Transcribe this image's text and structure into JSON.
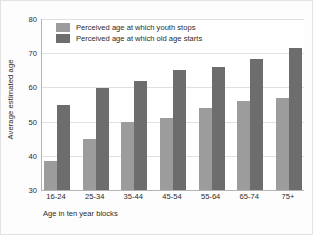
{
  "chart_data": {
    "type": "bar",
    "title": "",
    "xlabel": "Age in ten year blocks",
    "ylabel": "Average estimated age",
    "ylim": [
      30,
      80
    ],
    "ytick_labels": [
      "80",
      "70",
      "60",
      "50",
      "40",
      "30"
    ],
    "ytick_values": [
      80,
      70,
      60,
      50,
      40,
      30
    ],
    "grid": true,
    "legend_position": "top-left",
    "categories": [
      "16-24",
      "25-34",
      "35-44",
      "45-54",
      "55-64",
      "65-74",
      "75+"
    ],
    "series": [
      {
        "name": "Perceived age at which youth stops",
        "color": "#9c9c9c",
        "values": [
          38.5,
          45,
          49.8,
          51,
          54,
          56,
          57
        ]
      },
      {
        "name": "Perceived age at which old age starts",
        "color": "#6d6d6d",
        "values": [
          55,
          59.8,
          61.8,
          65,
          66,
          68.3,
          71.5
        ]
      }
    ]
  },
  "legend": {
    "items": [
      {
        "label": "Perceived age at which youth stops"
      },
      {
        "label": "Perceived age at which old age starts"
      }
    ]
  },
  "axes": {
    "y_title": "Average estimated age",
    "x_title": "Age in ten year blocks"
  }
}
